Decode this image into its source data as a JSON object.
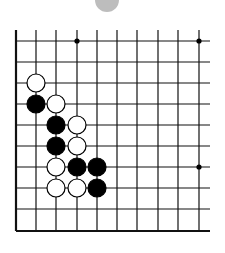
{
  "diagram": {
    "type": "go-board-fragment",
    "indicator": {
      "cx": 107,
      "cy": 0,
      "r": 12,
      "color": "#bdbdbd"
    },
    "grid": {
      "x_lines": [
        16,
        36,
        56,
        77,
        97,
        117,
        137,
        158,
        178,
        199
      ],
      "y_lines": [
        41,
        62,
        83,
        104,
        125,
        146,
        167,
        188,
        209,
        231
      ],
      "right_extent": 210,
      "top_extent": 30,
      "line_color": "#111111"
    },
    "star_points": [
      [
        3,
        0
      ],
      [
        9,
        0
      ],
      [
        9,
        6
      ]
    ],
    "stones": [
      {
        "col": 1,
        "row": 2,
        "color": "white"
      },
      {
        "col": 1,
        "row": 3,
        "color": "black"
      },
      {
        "col": 2,
        "row": 3,
        "color": "white"
      },
      {
        "col": 2,
        "row": 4,
        "color": "black"
      },
      {
        "col": 3,
        "row": 4,
        "color": "white"
      },
      {
        "col": 2,
        "row": 5,
        "color": "black"
      },
      {
        "col": 3,
        "row": 5,
        "color": "white"
      },
      {
        "col": 2,
        "row": 6,
        "color": "white"
      },
      {
        "col": 3,
        "row": 6,
        "color": "black"
      },
      {
        "col": 4,
        "row": 6,
        "color": "black"
      },
      {
        "col": 2,
        "row": 7,
        "color": "white"
      },
      {
        "col": 3,
        "row": 7,
        "color": "white"
      },
      {
        "col": 4,
        "row": 7,
        "color": "black"
      }
    ]
  }
}
